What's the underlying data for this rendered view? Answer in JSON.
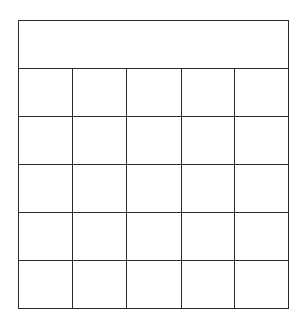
{
  "grid": {
    "header": {
      "text": ""
    },
    "columns": 5,
    "rows": [
      [
        "",
        "",
        "",
        "",
        ""
      ],
      [
        "",
        "",
        "",
        "",
        ""
      ],
      [
        "",
        "",
        "",
        "",
        ""
      ],
      [
        "",
        "",
        "",
        "",
        ""
      ],
      [
        "",
        "",
        "",
        "",
        ""
      ]
    ],
    "line_color": "#2a2a2a",
    "background": "#ffffff"
  }
}
